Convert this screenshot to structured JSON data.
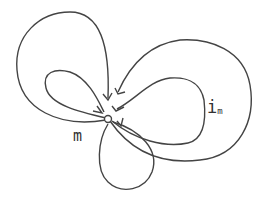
{
  "diagram": {
    "type": "loop-graph",
    "colors": {
      "stroke": "#444444",
      "background": "#ffffff"
    },
    "center_node": {
      "name": "vertex"
    },
    "loops": [
      {
        "id": "outer-left"
      },
      {
        "id": "inner-left"
      },
      {
        "id": "outer-right"
      },
      {
        "id": "inner-right"
      },
      {
        "id": "bottom"
      }
    ],
    "labels": {
      "m": "m",
      "i": "i",
      "i_sub": "m"
    }
  }
}
